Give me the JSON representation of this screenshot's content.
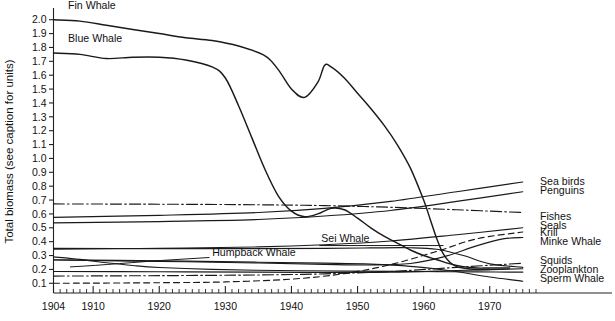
{
  "chart_data": {
    "type": "line",
    "title": "",
    "subtitle": "",
    "xlabel": "",
    "ylabel": "Total biomass (see caption for units)",
    "xlim": [
      1904,
      1977
    ],
    "ylim": [
      0.03,
      2.07
    ],
    "grid": false,
    "legend_position": "line-end-labels",
    "x_ticks_major": [
      1904,
      1910,
      1920,
      1930,
      1940,
      1950,
      1960,
      1970
    ],
    "x_tick_labels": [
      "1904",
      "1910",
      "1920",
      "1930",
      "1940",
      "1950",
      "1960",
      "1970"
    ],
    "x_tick_minor_step": 1,
    "y_ticks": [
      0.1,
      0.2,
      0.3,
      0.4,
      0.5,
      0.6,
      0.7,
      0.8,
      0.9,
      1.0,
      1.1,
      1.2,
      1.3,
      1.4,
      1.5,
      1.6,
      1.7,
      1.8,
      1.9,
      2.0
    ],
    "y_tick_labels": [
      "0.1",
      "0.2",
      "0.3",
      "0.4",
      "0.5",
      "0.6",
      "0.7",
      "0.8",
      "0.9",
      "1.0",
      "1.1",
      "1.2",
      "1.3",
      "1.4",
      "1.5",
      "1.6",
      "1.7",
      "1.8",
      "1.9",
      "2.0"
    ],
    "series": [
      {
        "name": "Fin Whale",
        "label": "Fin Whale",
        "label_side": "inside-top-left",
        "dash": "solid",
        "x": [
          1904,
          1908,
          1912,
          1916,
          1920,
          1924,
          1928,
          1932,
          1936,
          1938,
          1940,
          1942,
          1944,
          1945,
          1946,
          1948,
          1950,
          1952,
          1954,
          1956,
          1958,
          1960,
          1961,
          1962,
          1963,
          1964,
          1965,
          1966,
          1968,
          1970
        ],
        "y": [
          2.0,
          1.99,
          1.96,
          1.93,
          1.9,
          1.87,
          1.85,
          1.81,
          1.74,
          1.64,
          1.5,
          1.44,
          1.55,
          1.67,
          1.66,
          1.58,
          1.47,
          1.36,
          1.24,
          1.1,
          0.93,
          0.7,
          0.56,
          0.42,
          0.31,
          0.25,
          0.22,
          0.21,
          0.2,
          0.2
        ]
      },
      {
        "name": "Blue Whale",
        "label": "Blue Whale",
        "label_side": "inside-top-left",
        "dash": "solid",
        "x": [
          1904,
          1908,
          1912,
          1916,
          1920,
          1924,
          1928,
          1930,
          1932,
          1934,
          1936,
          1938,
          1940,
          1942,
          1944,
          1946,
          1948,
          1950,
          1952,
          1954,
          1956,
          1958,
          1960,
          1962,
          1964,
          1966,
          1968,
          1970,
          1973
        ],
        "y": [
          1.76,
          1.75,
          1.72,
          1.73,
          1.73,
          1.71,
          1.66,
          1.58,
          1.38,
          1.15,
          0.92,
          0.73,
          0.62,
          0.58,
          0.6,
          0.64,
          0.63,
          0.57,
          0.5,
          0.44,
          0.39,
          0.34,
          0.3,
          0.27,
          0.24,
          0.22,
          0.21,
          0.21,
          0.21
        ]
      },
      {
        "name": "Sea birds",
        "label": "Sea birds",
        "label_side": "right",
        "dash": "solid",
        "x": [
          1904,
          1920,
          1935,
          1945,
          1955,
          1965,
          1975
        ],
        "y": [
          0.575,
          0.59,
          0.61,
          0.64,
          0.69,
          0.76,
          0.83
        ]
      },
      {
        "name": "Penguins",
        "label": "Penguins",
        "label_side": "right",
        "dash": "solid",
        "x": [
          1904,
          1920,
          1935,
          1945,
          1955,
          1965,
          1975
        ],
        "y": [
          0.535,
          0.545,
          0.56,
          0.585,
          0.625,
          0.69,
          0.76
        ]
      },
      {
        "name": "Fishes",
        "label": "Fishes",
        "label_side": "right",
        "dash": "dashdot",
        "x": [
          1904,
          1920,
          1935,
          1945,
          1955,
          1965,
          1975
        ],
        "y": [
          0.672,
          0.67,
          0.666,
          0.66,
          0.648,
          0.63,
          0.61
        ]
      },
      {
        "name": "Seals",
        "label": "Seals",
        "label_side": "right",
        "dash": "solid",
        "x": [
          1904,
          1920,
          1935,
          1945,
          1955,
          1965,
          1975
        ],
        "y": [
          0.345,
          0.352,
          0.362,
          0.378,
          0.405,
          0.45,
          0.5
        ]
      },
      {
        "name": "Krill",
        "label": "Krill",
        "label_side": "right",
        "dash": "dashed",
        "x": [
          1904,
          1920,
          1930,
          1940,
          1948,
          1955,
          1962,
          1968,
          1975
        ],
        "y": [
          0.1,
          0.104,
          0.11,
          0.13,
          0.17,
          0.235,
          0.33,
          0.42,
          0.47
        ]
      },
      {
        "name": "Minke Whale",
        "label": "Minke Whale",
        "label_side": "right",
        "dash": "solid",
        "x": [
          1904,
          1920,
          1935,
          1945,
          1952,
          1958,
          1963,
          1968,
          1972,
          1975
        ],
        "y": [
          0.268,
          0.258,
          0.246,
          0.236,
          0.232,
          0.243,
          0.29,
          0.37,
          0.42,
          0.43
        ]
      },
      {
        "name": "Squids",
        "label": "Squids",
        "label_side": "right",
        "dash": "dashdot",
        "x": [
          1904,
          1920,
          1935,
          1945,
          1955,
          1965,
          1975
        ],
        "y": [
          0.152,
          0.155,
          0.16,
          0.168,
          0.185,
          0.215,
          0.245
        ]
      },
      {
        "name": "Zooplankton",
        "label": "Zooplankton",
        "label_side": "right",
        "dash": "solid",
        "x": [
          1904,
          1920,
          1935,
          1945,
          1955,
          1965,
          1975
        ],
        "y": [
          0.185,
          0.183,
          0.18,
          0.178,
          0.18,
          0.192,
          0.205
        ]
      },
      {
        "name": "Sperm Whale",
        "label": "Sperm Whale",
        "label_side": "right",
        "dash": "solid",
        "x": [
          1904,
          1920,
          1935,
          1945,
          1952,
          1958,
          1964,
          1970,
          1975
        ],
        "y": [
          0.27,
          0.262,
          0.252,
          0.245,
          0.238,
          0.222,
          0.19,
          0.145,
          0.115
        ]
      },
      {
        "name": "Humpback Whale",
        "label": "Humpback Whale",
        "label_side": "inside-leader",
        "dash": "solid",
        "x": [
          1904,
          1908,
          1912,
          1916,
          1920,
          1928,
          1938,
          1948,
          1956,
          1962,
          1968,
          1975
        ],
        "y": [
          0.29,
          0.272,
          0.248,
          0.228,
          0.214,
          0.2,
          0.192,
          0.188,
          0.186,
          0.184,
          0.182,
          0.18
        ]
      },
      {
        "name": "Sei Whale",
        "label": "Sei Whale",
        "label_side": "inside-leader",
        "dash": "solid",
        "x": [
          1904,
          1920,
          1935,
          1945,
          1952,
          1958,
          1962,
          1966,
          1970,
          1975
        ],
        "y": [
          0.352,
          0.35,
          0.35,
          0.352,
          0.355,
          0.356,
          0.345,
          0.3,
          0.24,
          0.215
        ]
      }
    ],
    "inside_annotations": [
      {
        "text": "Fin Whale",
        "x": 1906.2,
        "y": 2.075
      },
      {
        "text": "Blue Whale",
        "x": 1906.2,
        "y": 1.84
      },
      {
        "text": "Humpback Whale",
        "x": 1928.0,
        "y": 0.3
      },
      {
        "text": "Sei Whale",
        "x": 1944.5,
        "y": 0.395
      }
    ],
    "right_labels": [
      {
        "text": "Sea birds",
        "y": 0.835
      },
      {
        "text": "Penguins",
        "y": 0.77
      },
      {
        "text": "Fishes",
        "y": 0.585
      },
      {
        "text": "Seals",
        "y": 0.52
      },
      {
        "text": "Krill",
        "y": 0.47
      },
      {
        "text": "Minke Whale",
        "y": 0.4
      },
      {
        "text": "Squids",
        "y": 0.262
      },
      {
        "text": "Zooplankton",
        "y": 0.198
      },
      {
        "text": "Sperm Whale",
        "y": 0.132
      }
    ]
  },
  "colors": {
    "ink": "#1a1a1a",
    "background": "#ffffff",
    "axis": "#222222"
  }
}
